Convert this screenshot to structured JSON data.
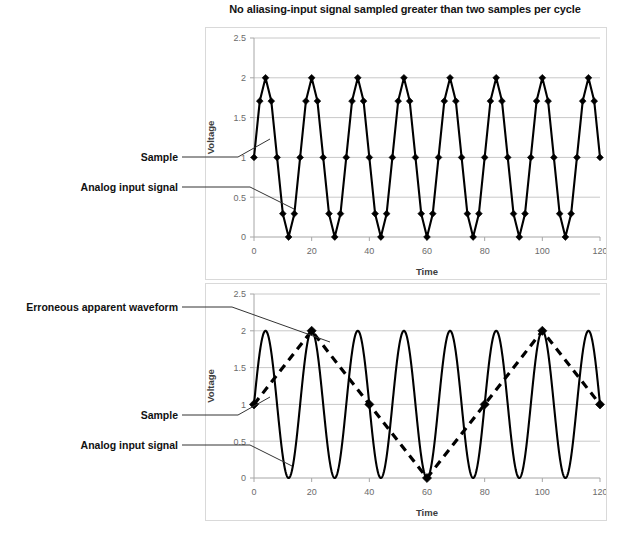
{
  "figure": {
    "title": "No aliasing-input signal sampled greater than two samples per cycle",
    "background": "#ffffff",
    "line_color": "#000000",
    "grid_color": "#c8c8c8"
  },
  "annotations": {
    "top": [
      {
        "label": "Sample"
      },
      {
        "label": "Analog input signal"
      }
    ],
    "bottom": [
      {
        "label": "Erroneous apparent waveform"
      },
      {
        "label": "Sample"
      },
      {
        "label": "Analog input signal"
      }
    ]
  },
  "chart_data": [
    {
      "id": "top-chart",
      "type": "line",
      "title": "No aliasing-input signal sampled greater than two samples per cycle",
      "xlabel": "Time",
      "ylabel": "Voltage",
      "xlim": [
        0,
        120
      ],
      "ylim": [
        0,
        2.5
      ],
      "xticks": [
        0,
        20,
        40,
        60,
        80,
        100,
        120
      ],
      "yticks": [
        0,
        0.5,
        1,
        1.5,
        2,
        2.5
      ],
      "xticklabels": [
        "0",
        "20",
        "40",
        "60",
        "80",
        "100",
        "120"
      ],
      "yticklabels": [
        "0",
        "0.5",
        "1",
        "1.5",
        "2",
        "2.5"
      ],
      "grid": true,
      "legend": false,
      "series": [
        {
          "name": "Analog input signal with samples",
          "style": "solid-with-diamond-markers",
          "markers": true,
          "sample_interval": 2,
          "signal_period": 16,
          "signal_amplitude": 1,
          "signal_offset": 1,
          "samples_per_cycle": 8,
          "x": [
            0,
            2,
            4,
            6,
            8,
            10,
            12,
            14,
            16,
            18,
            20,
            22,
            24,
            26,
            28,
            30,
            32,
            34,
            36,
            38,
            40,
            42,
            44,
            46,
            48,
            50,
            52,
            54,
            56,
            58,
            60,
            62,
            64,
            66,
            68,
            70,
            72,
            74,
            76,
            78,
            80,
            82,
            84,
            86,
            88,
            90,
            92,
            94,
            96,
            98,
            100,
            102,
            104,
            106,
            108,
            110,
            112,
            114,
            116,
            118,
            120
          ],
          "y": [
            1,
            1.707,
            2,
            1.707,
            1,
            0.293,
            0,
            0.293,
            1,
            1.707,
            2,
            1.707,
            1,
            0.293,
            0,
            0.293,
            1,
            1.707,
            2,
            1.707,
            1,
            0.293,
            0,
            0.293,
            1,
            1.707,
            2,
            1.707,
            1,
            0.293,
            0,
            0.293,
            1,
            1.707,
            2,
            1.707,
            1,
            0.293,
            0,
            0.293,
            1,
            1.707,
            2,
            1.707,
            1,
            0.293,
            0,
            0.293,
            1,
            1.707,
            2,
            1.707,
            1,
            0.293,
            0,
            0.293,
            1,
            1.707,
            2,
            1.707,
            1
          ]
        }
      ]
    },
    {
      "id": "bottom-chart",
      "type": "line",
      "title": "",
      "xlabel": "Time",
      "ylabel": "Voltage",
      "xlim": [
        0,
        120
      ],
      "ylim": [
        0,
        2.5
      ],
      "xticks": [
        0,
        20,
        40,
        60,
        80,
        100,
        120
      ],
      "yticks": [
        0,
        0.5,
        1,
        1.5,
        2,
        2.5
      ],
      "xticklabels": [
        "0",
        "20",
        "40",
        "60",
        "80",
        "100",
        "120"
      ],
      "yticklabels": [
        "0",
        "0.5",
        "1",
        "1.5",
        "2",
        "2.5"
      ],
      "grid": true,
      "legend": false,
      "series": [
        {
          "name": "Analog input signal",
          "style": "solid",
          "markers": false,
          "signal_period": 16,
          "signal_amplitude": 1,
          "signal_offset": 1,
          "cycles": 7.5
        },
        {
          "name": "Erroneous apparent waveform",
          "style": "dashed-with-diamond-markers",
          "markers": true,
          "sample_interval": 20,
          "signal_period": 80,
          "signal_amplitude": 1,
          "signal_offset": 1,
          "x": [
            0,
            20,
            40,
            60,
            80,
            100,
            120
          ],
          "y": [
            1,
            2,
            1,
            0,
            1,
            2,
            1
          ]
        }
      ]
    }
  ]
}
